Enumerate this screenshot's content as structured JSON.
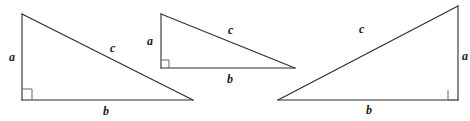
{
  "figure": {
    "canvas": {
      "width": 470,
      "height": 121
    },
    "style": {
      "background_color": "#ffffff",
      "stroke_color": "#2b2b2b",
      "label_color": "#1a1a1a",
      "stroke_width": 1.1
    },
    "triangles": [
      {
        "name": "triangle-left",
        "vertices": {
          "top": [
            22,
            14
          ],
          "right_angle": [
            22,
            100
          ],
          "far": [
            193,
            100
          ]
        },
        "right_angle_marker": {
          "x": 22,
          "y": 89,
          "size": 10
        },
        "labels": [
          {
            "name": "label-a-left",
            "text": "a",
            "x": 9,
            "y": 51
          },
          {
            "name": "label-c-left",
            "text": "c",
            "x": 110,
            "y": 42
          },
          {
            "name": "label-b-left",
            "text": "b",
            "x": 103,
            "y": 105
          }
        ]
      },
      {
        "name": "triangle-middle",
        "vertices": {
          "top": [
            161,
            14
          ],
          "right_angle": [
            161,
            68
          ],
          "far": [
            295,
            68
          ]
        },
        "right_angle_marker": {
          "x": 161,
          "y": 60,
          "size": 8
        },
        "labels": [
          {
            "name": "label-a-middle",
            "text": "a",
            "x": 147,
            "y": 35
          },
          {
            "name": "label-c-middle",
            "text": "c",
            "x": 228,
            "y": 24
          },
          {
            "name": "label-b-middle",
            "text": "b",
            "x": 227,
            "y": 73
          }
        ]
      },
      {
        "name": "triangle-right",
        "vertices": {
          "far": [
            278,
            100
          ],
          "right_angle": [
            458,
            100
          ],
          "top": [
            458,
            6
          ]
        },
        "right_angle_marker": {
          "x": 448,
          "y": 90,
          "size": 10
        },
        "labels": [
          {
            "name": "label-c-right",
            "text": "c",
            "x": 359,
            "y": 23
          },
          {
            "name": "label-a-right",
            "text": "a",
            "x": 462,
            "y": 50
          },
          {
            "name": "label-b-right",
            "text": "b",
            "x": 366,
            "y": 104
          }
        ]
      }
    ]
  }
}
